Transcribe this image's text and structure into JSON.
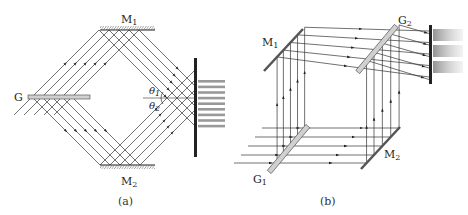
{
  "figure": {
    "panel_a": {
      "caption": "(a)",
      "labels": {
        "mirror_1": {
          "main": "M",
          "sub": "1"
        },
        "mirror_2": {
          "main": "M",
          "sub": "2"
        },
        "grating": {
          "main": "G",
          "sub": ""
        },
        "theta_1": {
          "main": "θ",
          "sub": "1"
        },
        "theta_2": {
          "main": "θ",
          "sub": "2"
        }
      },
      "fringe_count": 9
    },
    "panel_b": {
      "caption": "(b)",
      "labels": {
        "mirror_1": {
          "main": "M",
          "sub": "1"
        },
        "mirror_2": {
          "main": "M",
          "sub": "2"
        },
        "grating_1": {
          "main": "G",
          "sub": "1"
        },
        "grating_2": {
          "main": "G",
          "sub": "2"
        }
      },
      "fringe_bands": 3
    }
  }
}
